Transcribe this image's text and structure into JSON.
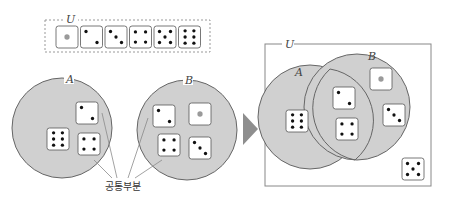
{
  "top_universe": {
    "label": "U",
    "dice": [
      1,
      2,
      3,
      4,
      5,
      6
    ]
  },
  "left": {
    "set_a": {
      "label": "A",
      "dice": [
        6,
        2,
        4
      ]
    },
    "set_b": {
      "label": "B",
      "dice": [
        2,
        1,
        4,
        3
      ]
    },
    "callout": "공통부분"
  },
  "right": {
    "universe_label": "U",
    "set_a_label": "A",
    "set_b_label": "B",
    "only_a": [
      6
    ],
    "intersection": [
      2,
      4
    ],
    "only_b": [
      1,
      3
    ],
    "outside": [
      5
    ]
  },
  "colors": {
    "circle_fill": "#d0d0d0",
    "circle_stroke": "#666666",
    "pip": "#111111",
    "one_pip": "#9a9a9a",
    "arrow": "#8a8a8a"
  }
}
